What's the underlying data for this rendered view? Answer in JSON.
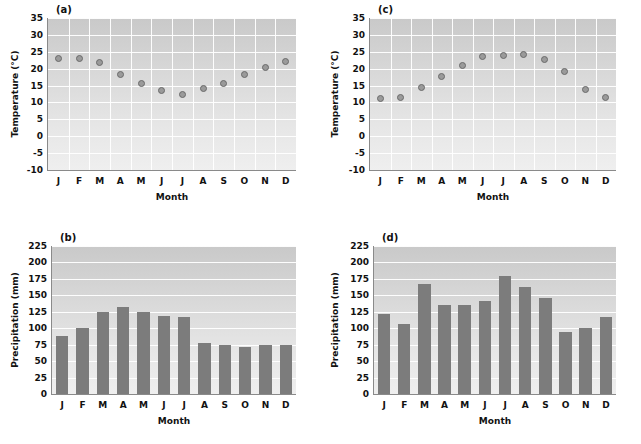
{
  "figure": {
    "panels": [
      {
        "id": "a",
        "label": "(a)",
        "kind": "temperature"
      },
      {
        "id": "b",
        "label": "(b)",
        "kind": "precipitation"
      },
      {
        "id": "c",
        "label": "(c)",
        "kind": "temperature"
      },
      {
        "id": "d",
        "label": "(d)",
        "kind": "precipitation"
      }
    ],
    "colors": {
      "marker_fill": "#9a9a9a",
      "marker_edge": "#6a6a6a",
      "bar_fill": "#7c7c7c",
      "grid": "#ffffff",
      "axis": "#8a8a8a",
      "plot_bg_top": "#c9c9c9",
      "plot_bg_bottom": "#efefef"
    }
  },
  "chart_data": [
    {
      "type": "scatter",
      "panel": "a",
      "title": "(a)",
      "xlabel": "Month",
      "ylabel": "Temperature (°C)",
      "categories": [
        "J",
        "F",
        "M",
        "A",
        "M",
        "J",
        "J",
        "A",
        "S",
        "O",
        "N",
        "D"
      ],
      "values": [
        22.9,
        23.0,
        21.9,
        18.3,
        15.5,
        13.4,
        12.3,
        14.2,
        15.5,
        18.4,
        20.3,
        22.0
      ],
      "ylim": [
        -10,
        35
      ],
      "yticks": [
        35,
        30,
        25,
        20,
        15,
        10,
        5,
        0,
        -5,
        -10
      ],
      "grid": true,
      "legend": "none"
    },
    {
      "type": "bar",
      "panel": "b",
      "title": "(b)",
      "xlabel": "Month",
      "ylabel": "Precipitation (mm)",
      "categories": [
        "J",
        "F",
        "M",
        "A",
        "M",
        "J",
        "J",
        "A",
        "S",
        "O",
        "N",
        "D"
      ],
      "values": [
        88,
        100,
        125,
        133,
        125,
        118,
        117,
        77,
        74,
        72,
        75,
        75
      ],
      "ylim": [
        0,
        225
      ],
      "yticks": [
        225,
        200,
        175,
        150,
        125,
        100,
        75,
        50,
        25,
        0
      ],
      "grid": true,
      "legend": "none"
    },
    {
      "type": "scatter",
      "panel": "c",
      "title": "(c)",
      "xlabel": "Month",
      "ylabel": "Temperature (°C)",
      "categories": [
        "J",
        "F",
        "M",
        "A",
        "M",
        "J",
        "J",
        "A",
        "S",
        "O",
        "N",
        "D"
      ],
      "values": [
        11.2,
        11.5,
        14.3,
        17.7,
        20.9,
        23.7,
        24.0,
        24.1,
        22.8,
        19.1,
        13.9,
        11.5
      ],
      "ylim": [
        -10,
        35
      ],
      "yticks": [
        35,
        30,
        25,
        20,
        15,
        10,
        5,
        0,
        -5,
        -10
      ],
      "grid": true,
      "legend": "none"
    },
    {
      "type": "bar",
      "panel": "d",
      "title": "(d)",
      "xlabel": "Month",
      "ylabel": "Precipitation (mm)",
      "categories": [
        "J",
        "F",
        "M",
        "A",
        "M",
        "J",
        "J",
        "A",
        "S",
        "O",
        "N",
        "D"
      ],
      "values": [
        122,
        107,
        167,
        136,
        136,
        142,
        179,
        163,
        146,
        94,
        101,
        117
      ],
      "ylim": [
        0,
        225
      ],
      "yticks": [
        225,
        200,
        175,
        150,
        125,
        100,
        75,
        50,
        25,
        0
      ],
      "grid": true,
      "legend": "none"
    }
  ]
}
